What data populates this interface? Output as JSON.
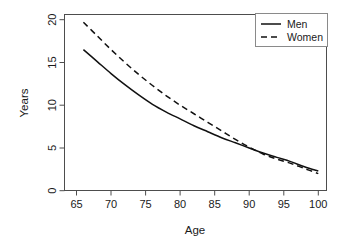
{
  "chart_data": {
    "type": "line",
    "title": "",
    "subtitle": "",
    "xlabel": "Age",
    "ylabel": "Years",
    "xlim": [
      63.5,
      101.5
    ],
    "ylim": [
      -0.4,
      20.4
    ],
    "xticks": [
      65,
      70,
      75,
      80,
      85,
      90,
      95,
      100
    ],
    "yticks": [
      0,
      5,
      10,
      15,
      20
    ],
    "xtick_labels": [
      "65",
      "70",
      "75",
      "80",
      "85",
      "90",
      "95",
      "100"
    ],
    "ytick_labels": [
      "0",
      "5",
      "10",
      "15",
      "20"
    ],
    "grid": false,
    "legend_position": "top-right",
    "x": [
      66,
      68,
      70,
      72,
      74,
      76,
      78,
      80,
      82,
      84,
      86,
      88,
      90,
      92,
      94,
      96,
      98,
      100
    ],
    "series": [
      {
        "name": "Men",
        "style": "solid",
        "color": "#111111",
        "values": [
          16.5,
          15.1,
          13.7,
          12.4,
          11.2,
          10.1,
          9.2,
          8.4,
          7.6,
          6.9,
          6.2,
          5.6,
          5.0,
          4.4,
          3.9,
          3.4,
          2.8,
          2.3
        ]
      },
      {
        "name": "Women",
        "style": "dashed",
        "color": "#111111",
        "values": [
          19.7,
          18.1,
          16.5,
          15.0,
          13.6,
          12.3,
          11.1,
          10.0,
          9.0,
          8.0,
          7.0,
          6.0,
          5.1,
          4.3,
          3.7,
          3.2,
          2.6,
          2.0
        ]
      }
    ],
    "annotations": []
  },
  "legend": {
    "entries": [
      {
        "label": "Men",
        "dash": "solid"
      },
      {
        "label": "Women",
        "dash": "dashed"
      }
    ]
  },
  "axes": {
    "x_title": "Age",
    "y_title": "Years"
  }
}
